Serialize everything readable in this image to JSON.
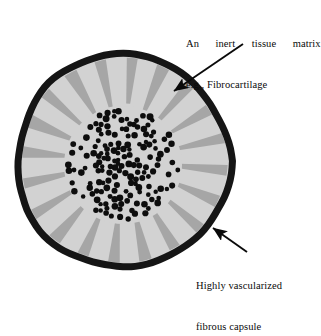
{
  "figure": {
    "type": "biological-cross-section-diagram",
    "colors": {
      "background": "#ffffff",
      "capsule_outline": "#151515",
      "matrix_fill": "#d2d2d2",
      "spoke_fill": "#a6a6a6",
      "core_fill": "#d2d2d2",
      "cell_fill": "#0d0d0d",
      "arrow": "#0a0a0a",
      "text": "#0a0a0a"
    },
    "geometry": {
      "center_x": 123,
      "center_y": 161,
      "outer_radius": 110,
      "capsule_thickness": 7,
      "core_radius": 56,
      "spoke_count": 20,
      "cell_count": 158
    }
  },
  "annotations": {
    "matrix": {
      "line1": "An  inert  tissue  matrix",
      "line2": "e.g., Fibrocartilage",
      "arrow_from_x": 243,
      "arrow_from_y": 44,
      "arrow_to_x": 174,
      "arrow_to_y": 91
    },
    "capsule": {
      "line1": "Highly vascularized",
      "line2": "fibrous capsule",
      "arrow_from_x": 247,
      "arrow_from_y": 252,
      "arrow_to_x": 213,
      "arrow_to_y": 228
    }
  }
}
